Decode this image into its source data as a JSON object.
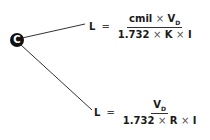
{
  "node": {
    "label": "C"
  },
  "formulas": [
    {
      "lhs": "L",
      "eq": "=",
      "num_a": "cmil",
      "times1": "×",
      "num_b": "V",
      "num_b_sub": "D",
      "den_a": "1.732",
      "times2": "×",
      "den_b": "K",
      "times3": "×",
      "den_c": "I"
    },
    {
      "lhs": "L",
      "eq": "=",
      "num_b": "V",
      "num_b_sub": "D",
      "den_a": "1.732",
      "times2": "×",
      "den_b": "R",
      "times3": "×",
      "den_c": "I"
    }
  ],
  "colors": {
    "line": "#333333",
    "node": "#111111"
  }
}
